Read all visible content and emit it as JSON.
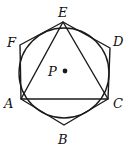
{
  "diagram": {
    "stroke_color": "#1a1a1a",
    "background": "#ffffff",
    "circle": {
      "cx": 64,
      "cy": 73,
      "r": 45,
      "center_label": "P"
    },
    "points": [
      {
        "name": "A",
        "x": 21,
        "y": 99,
        "label": "A",
        "lx": 4,
        "ly": 108
      },
      {
        "name": "B",
        "x": 64,
        "y": 125,
        "label": "B",
        "lx": 58,
        "ly": 144
      },
      {
        "name": "C",
        "x": 108,
        "y": 99,
        "label": "C",
        "lx": 113,
        "ly": 108
      },
      {
        "name": "D",
        "x": 110,
        "y": 48,
        "label": "D",
        "lx": 113,
        "ly": 46
      },
      {
        "name": "E",
        "x": 63,
        "y": 22,
        "label": "E",
        "lx": 58,
        "ly": 17
      },
      {
        "name": "F",
        "x": 20,
        "y": 45,
        "label": "F",
        "lx": 7,
        "ly": 47
      }
    ],
    "center": {
      "x": 65,
      "y": 71,
      "label": "P",
      "lx": 48,
      "ly": 76
    },
    "hexagon": "ABCDEF",
    "triangle": "ACE"
  }
}
